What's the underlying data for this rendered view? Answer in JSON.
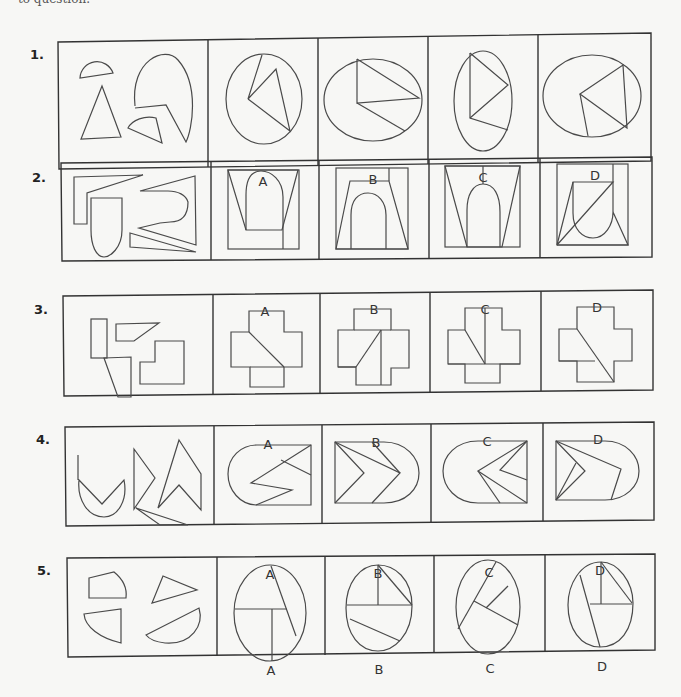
{
  "header": {
    "cut_text": "to question."
  },
  "questions": [
    {
      "number": "1.",
      "options": [
        "A",
        "B",
        "C",
        "D"
      ],
      "pieces": "semicircle, triangle, large notched oval, wedge"
    },
    {
      "number": "2.",
      "options": [
        "A",
        "B",
        "C",
        "D"
      ],
      "pieces": "L-shape, bullet/arch, U-notched trapezoid, sliver"
    },
    {
      "number": "3.",
      "options": [
        "A",
        "B",
        "C",
        "D"
      ],
      "pieces": "bar rectangle, parallelogram, trapezoid, L-block"
    },
    {
      "number": "4.",
      "options": [
        "A",
        "B",
        "C",
        "D"
      ],
      "pieces": "V-cup, arrow triangle, chevron, sliver triangle"
    },
    {
      "number": "5.",
      "options": [
        "A",
        "B",
        "C",
        "D"
      ],
      "pieces": "quarter-cap, triangle, fan sector, crescent segment"
    }
  ]
}
